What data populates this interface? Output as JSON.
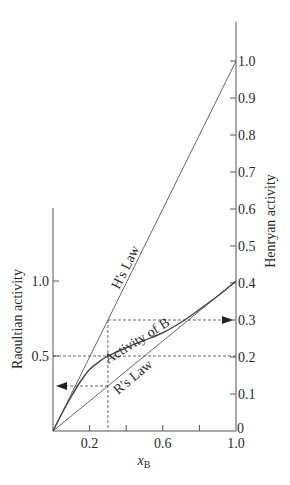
{
  "chart_data": {
    "type": "line",
    "title": "",
    "xlabel": "x",
    "xlabel_sub": "B",
    "ylabel_left": "Raoultian activity",
    "ylabel_right": "Henryan activity",
    "xlim": [
      0,
      1.0
    ],
    "ylim_left": [
      0,
      1.0
    ],
    "ylim_right": [
      0,
      1.0
    ],
    "x_ticks": [
      0.2,
      0.4,
      0.6,
      0.8,
      1.0
    ],
    "x_tick_labels": [
      {
        "value": 0.2,
        "label": "0.2"
      },
      {
        "value": 0.6,
        "label": "0.6"
      },
      {
        "value": 1.0,
        "label": "1.0"
      }
    ],
    "left_ticks": [
      {
        "value": 0.5,
        "label": "0.5"
      },
      {
        "value": 1.0,
        "label": "1.0"
      }
    ],
    "right_ticks": [
      {
        "value": 0.0,
        "label": "0"
      },
      {
        "value": 0.1,
        "label": "0.1"
      },
      {
        "value": 0.2,
        "label": "0.2"
      },
      {
        "value": 0.3,
        "label": "0.3"
      },
      {
        "value": 0.4,
        "label": "0.4"
      },
      {
        "value": 0.5,
        "label": "0.5"
      },
      {
        "value": 0.6,
        "label": "0.6"
      },
      {
        "value": 0.7,
        "label": "0.7"
      },
      {
        "value": 0.8,
        "label": "0.8"
      },
      {
        "value": 0.9,
        "label": "0.9"
      },
      {
        "value": 1.0,
        "label": "1.0"
      }
    ],
    "series": [
      {
        "name": "H's Law",
        "axis": "right",
        "x": [
          0,
          1.0
        ],
        "values": [
          0,
          1.0
        ]
      },
      {
        "name": "R's Law",
        "axis": "left",
        "x": [
          0,
          1.0
        ],
        "values": [
          0,
          1.0
        ]
      },
      {
        "name": "Activity of B",
        "axis": "left",
        "x": [
          0,
          0.05,
          0.1,
          0.15,
          0.2,
          0.25,
          0.3,
          0.4,
          0.5,
          0.6,
          0.7,
          0.8,
          0.9,
          1.0
        ],
        "values": [
          0,
          0.12,
          0.23,
          0.33,
          0.41,
          0.46,
          0.5,
          0.555,
          0.605,
          0.655,
          0.725,
          0.81,
          0.9,
          1.0
        ]
      }
    ],
    "annotations": [
      {
        "type": "dashed-vertical",
        "x": 0.3,
        "from_right": 0.3,
        "to": 0
      },
      {
        "type": "dashed-horizontal-arrow",
        "direction": "right",
        "x_from": 0.3,
        "right_value": 0.3,
        "label": "Henryan activity 0.3"
      },
      {
        "type": "dashed-horizontal",
        "left_value": 0.5,
        "x_from": 0,
        "x_to": 1.0
      },
      {
        "type": "dashed-horizontal-arrow",
        "direction": "left",
        "x_from": 0.3,
        "left_value": 0.3,
        "label": "Raoultian activity 0.3"
      }
    ],
    "grid": false,
    "legend": "none"
  }
}
